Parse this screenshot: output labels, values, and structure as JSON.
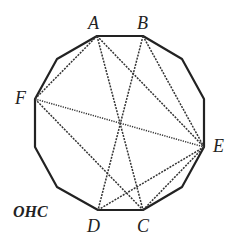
{
  "figure": {
    "brand_label": "OHC",
    "colors": {
      "stroke": "#222222",
      "background": "#ffffff"
    },
    "polygon": {
      "sides": 12,
      "vertices": [
        [
          97,
          36
        ],
        [
          143,
          36
        ],
        [
          182,
          59
        ],
        [
          204,
          99
        ],
        [
          204,
          147
        ],
        [
          182,
          187
        ],
        [
          143,
          210
        ],
        [
          98,
          210
        ],
        [
          57,
          187
        ],
        [
          35,
          147
        ],
        [
          35,
          99
        ],
        [
          57,
          59
        ]
      ]
    },
    "points": {
      "A": {
        "label": "A",
        "x": 97,
        "y": 36
      },
      "B": {
        "label": "B",
        "x": 143,
        "y": 36
      },
      "C": {
        "label": "C",
        "x": 143,
        "y": 210
      },
      "D": {
        "label": "D",
        "x": 98,
        "y": 210
      },
      "E": {
        "label": "E",
        "x": 204,
        "y": 147
      },
      "F": {
        "label": "F",
        "x": 35,
        "y": 99
      }
    },
    "chords": [
      {
        "from": "A",
        "to": "F",
        "style": "dashed"
      },
      {
        "from": "A",
        "to": "C",
        "style": "dashed"
      },
      {
        "from": "A",
        "to": "E",
        "style": "dashed"
      },
      {
        "from": "B",
        "to": "D",
        "style": "dashed"
      },
      {
        "from": "B",
        "to": "E",
        "style": "dashed"
      },
      {
        "from": "F",
        "to": "E",
        "style": "dotted"
      },
      {
        "from": "F",
        "to": "C",
        "style": "dashed"
      },
      {
        "from": "D",
        "to": "E",
        "style": "dashed"
      },
      {
        "from": "C",
        "to": "E",
        "style": "dashed"
      }
    ]
  }
}
